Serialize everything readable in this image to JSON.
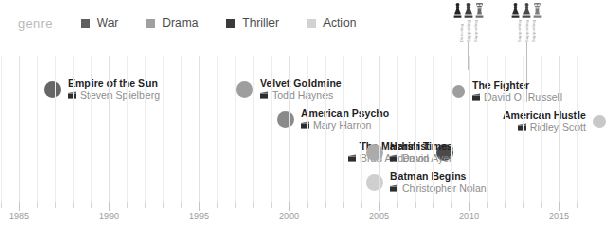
{
  "legend": {
    "title": "genre",
    "items": [
      {
        "label": "War",
        "color": "#5e5e5e",
        "icon": "square-swatch"
      },
      {
        "label": "Drama",
        "color": "#a0a0a0",
        "icon": "square-swatch"
      },
      {
        "label": "Thriller",
        "color": "#3a3a3a",
        "icon": "square-swatch"
      },
      {
        "label": "Action",
        "color": "#d2d2d2",
        "icon": "square-swatch"
      }
    ]
  },
  "chart_data": {
    "type": "scatter",
    "title": "",
    "xlabel": "",
    "ylabel": "",
    "xlim": [
      1984,
      2016
    ],
    "grid": true,
    "legend_position": "top",
    "xticks": [
      1985,
      1990,
      1995,
      2000,
      2005,
      2010,
      2015
    ],
    "xtick_labels": [
      "1985",
      "1990",
      "1995",
      "2000",
      "2005",
      "2010",
      "2015"
    ],
    "points": [
      {
        "title": "Empire of the Sun",
        "director": "Steven Spielberg",
        "year": 1987,
        "genre": "War",
        "color": "#666666",
        "size": "large",
        "label_side": "right",
        "row": 0
      },
      {
        "title": "Velvet Goldmine",
        "director": "Todd Haynes",
        "year": 1998,
        "genre": "Drama",
        "color": "#9e9e9e",
        "size": "large",
        "label_side": "right",
        "row": 0
      },
      {
        "title": "The Fighter",
        "director": "David O. Russell",
        "year": 2010,
        "genre": "Drama",
        "color": "#9e9e9e",
        "size": "small",
        "label_side": "right",
        "row": 0
      },
      {
        "title": "American Psycho",
        "director": "Mary Harron",
        "year": 2000,
        "genre": "Thriller",
        "color": "#8a8a8a",
        "size": "large",
        "label_side": "right",
        "row": 1
      },
      {
        "title": "American Hustle",
        "director": "Ridley Scott",
        "year": 2013,
        "genre": "Drama",
        "color": "#c8c8c8",
        "size": "small",
        "label_side": "left",
        "row": 1
      },
      {
        "title": "The Machinist",
        "director": "Brad Anderson",
        "year": 2004,
        "genre": "Thriller",
        "color": "#4a4a4a",
        "size": "large",
        "label_side": "left",
        "row": 2
      },
      {
        "title": "Harsh Times",
        "director": "David Ayer",
        "year": 2005,
        "genre": "Drama",
        "color": "#ababab",
        "size": "large",
        "label_side": "right",
        "row": 2
      },
      {
        "title": "Batman Begins",
        "director": "Christopher Nolan",
        "year": 2005,
        "genre": "Action",
        "color": "#cfcfcf",
        "size": "large",
        "label_side": "right",
        "row": 3
      }
    ]
  },
  "awards": [
    {
      "year": 2010,
      "icons": [
        {
          "shape": "pawn-dark",
          "label": "Directing"
        },
        {
          "shape": "pawn-mid",
          "label": "Supporting"
        },
        {
          "shape": "trophy-dark",
          "label": "Supporting"
        }
      ]
    },
    {
      "year": 2013,
      "icons": [
        {
          "shape": "pawn-dark",
          "label": "Supporting"
        },
        {
          "shape": "pawn-mid",
          "label": "Supporting"
        },
        {
          "shape": "trophy-mid",
          "label": "Supporting"
        }
      ]
    }
  ],
  "colors": {
    "background": "#ffffff",
    "gridline": "#ededed",
    "axis_text": "#9b9b9b",
    "title_text": "#1f1f1f",
    "director_text": "#8d8d8d",
    "legend_title": "#b9b9b9"
  }
}
